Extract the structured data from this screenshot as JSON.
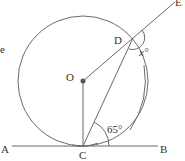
{
  "diagram": {
    "type": "circle-geometry",
    "points": {
      "O": {
        "label": "O",
        "x": 83,
        "y": 81
      },
      "C": {
        "label": "C",
        "x": 83,
        "y": 146
      },
      "D": {
        "label": "D",
        "x": 133,
        "y": 38
      },
      "E": {
        "label": "E",
        "x": 176,
        "y": 2
      },
      "A": {
        "label": "A",
        "x": 3,
        "y": 146
      },
      "B": {
        "label": "B",
        "x": 162,
        "y": 146
      }
    },
    "circle": {
      "center": "O",
      "radius": 65
    },
    "angles": {
      "given": {
        "label": "65°",
        "value": 65,
        "at": "C",
        "between": [
          "D",
          "B"
        ]
      },
      "unknown": {
        "label": "x°",
        "variable": "x",
        "at": "D",
        "between": [
          "E",
          "C"
        ]
      }
    },
    "segments": [
      "OC",
      "OD",
      "CD",
      "DE",
      "AB"
    ],
    "stray_text": "e"
  }
}
